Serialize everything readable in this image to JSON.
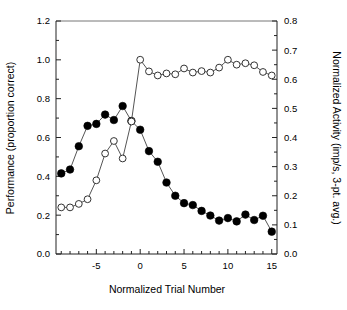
{
  "chart_data": {
    "type": "line",
    "title": "",
    "xlabel": "Normalized Trial Number",
    "ylabel": "Performance (proportion correct)",
    "ylabel_right": "Normalized Activity (imp/s, 3-pt. avg.)",
    "xlim": [
      -9.6,
      15.6
    ],
    "ylim": [
      0.0,
      1.2
    ],
    "ylim_right": [
      0.0,
      0.8
    ],
    "grid": false,
    "legend": "none",
    "x_ticks": [
      -5,
      0,
      5,
      10,
      15
    ],
    "x_tick_labels": [
      "-5",
      "0",
      "5",
      "10",
      "15"
    ],
    "x_minor_ticks": [
      -9,
      -8,
      -7,
      -6,
      -4,
      -3,
      -2,
      -1,
      1,
      2,
      3,
      4,
      6,
      7,
      8,
      9,
      11,
      12,
      13,
      14
    ],
    "y_ticks": [
      0.0,
      0.2,
      0.4,
      0.6,
      0.8,
      1.0,
      1.2
    ],
    "y_tick_labels": [
      "0.0",
      "0.2",
      "0.4",
      "0.6",
      "0.8",
      "1.0",
      "1.2"
    ],
    "y_minor_ticks": [
      0.1,
      0.3,
      0.5,
      0.7,
      0.9,
      1.1
    ],
    "y_right_ticks": [
      0.0,
      0.1,
      0.2,
      0.3,
      0.4,
      0.5,
      0.6,
      0.7,
      0.8
    ],
    "y_right_tick_labels": [
      "0.0",
      "0.1",
      "0.2",
      "0.3",
      "0.4",
      "0.5",
      "0.6",
      "0.7",
      "0.8"
    ],
    "y_right_minor_ticks": [
      0.05,
      0.15,
      0.25,
      0.35,
      0.45,
      0.55,
      0.65,
      0.75
    ],
    "series": [
      {
        "name": "Performance (proportion correct)",
        "axis": "left",
        "marker": "filled-circle",
        "marker_color": "#000000",
        "line_color": "#555555",
        "x": [
          -9,
          -8,
          -7,
          -6,
          -5,
          -4,
          -3,
          -2,
          -1,
          0,
          1,
          2,
          3,
          4,
          5,
          6,
          7,
          8,
          9,
          10,
          11,
          12,
          13,
          14,
          15
        ],
        "values": [
          0.415,
          0.435,
          0.555,
          0.66,
          0.67,
          0.718,
          0.69,
          0.762,
          0.685,
          0.64,
          0.53,
          0.475,
          0.368,
          0.3,
          0.262,
          0.252,
          0.222,
          0.198,
          0.172,
          0.185,
          0.168,
          0.203,
          0.175,
          0.197,
          0.115
        ]
      },
      {
        "name": "Normalized Activity (imp/s, 3-pt. avg.)",
        "axis": "right",
        "marker": "open-circle",
        "marker_color": "#ffffff",
        "line_color": "#555555",
        "x": [
          -9,
          -8,
          -7,
          -6,
          -5,
          -4,
          -3,
          -2,
          -1,
          0,
          1,
          2,
          3,
          4,
          5,
          6,
          7,
          8,
          9,
          10,
          11,
          12,
          13,
          14,
          15
        ],
        "values_right_axis": [
          0.16,
          0.16,
          0.172,
          0.188,
          0.253,
          0.345,
          0.388,
          0.328,
          0.455,
          0.667,
          0.627,
          0.613,
          0.62,
          0.617,
          0.637,
          0.623,
          0.628,
          0.623,
          0.64,
          0.667,
          0.65,
          0.655,
          0.648,
          0.625,
          0.613
        ]
      }
    ]
  }
}
